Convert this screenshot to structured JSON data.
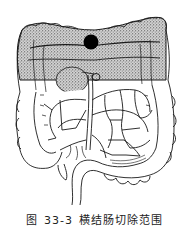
{
  "figure": {
    "caption": {
      "label": "图",
      "number": "33-3",
      "title": "横结肠切除范围"
    },
    "annotations": {
      "tumor_marker": "tumor",
      "shaded_region": "resection-extent"
    },
    "colors": {
      "line": "#1a1a1a",
      "stipple": "#2b2b2b",
      "shade_bg": "#cfcfcf",
      "tumor": "#000000",
      "background": "#ffffff"
    }
  }
}
